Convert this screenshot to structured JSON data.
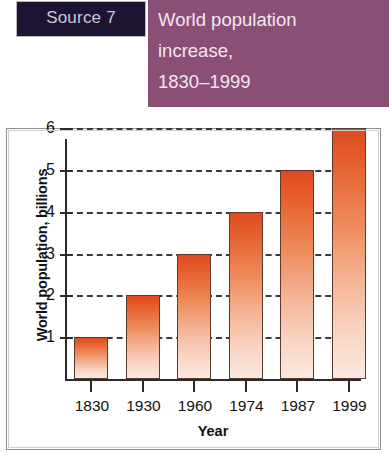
{
  "header": {
    "source_badge": "Source 7",
    "title_lines": [
      "World population",
      "increase,",
      "1830–1999"
    ],
    "badge_bg": "#1c1430",
    "panel_bg": "#8b4e75",
    "text_color": "#f1e9f0"
  },
  "chart_data": {
    "type": "bar",
    "title": "World population increase, 1830–1999",
    "xlabel": "Year",
    "ylabel": "World population, billions",
    "categories": [
      "1830",
      "1930",
      "1960",
      "1974",
      "1987",
      "1999"
    ],
    "values": [
      1,
      2,
      3,
      4,
      5,
      6
    ],
    "ylim": [
      0,
      6.4
    ],
    "yticks": [
      1,
      2,
      3,
      4,
      5,
      6
    ],
    "ytick_labels": [
      "1",
      "2",
      "3",
      "4",
      "5",
      "6"
    ],
    "grid": "horizontal-dashed",
    "legend": "none",
    "bar_gradient_top": "#df4a1f",
    "bar_gradient_bottom": "#fbe9e0",
    "bar_border": "#5b3a30",
    "axis_color": "#2b2b2b"
  }
}
